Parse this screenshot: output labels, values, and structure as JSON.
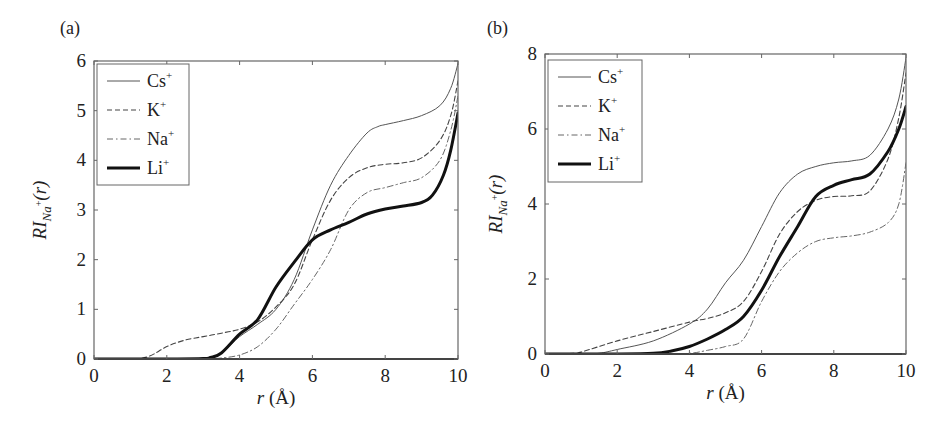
{
  "chart_data": [
    {
      "panel_label": "(a)",
      "type": "line",
      "title": "",
      "xlabel": "r (Å)",
      "xlabel_italic": "r",
      "xlabel_unit": "(Å)",
      "ylabel": "RI_Na+(r)",
      "xlim": [
        0,
        10
      ],
      "ylim": [
        0,
        6
      ],
      "xticks": [
        0,
        2,
        4,
        6,
        8,
        10
      ],
      "yticks": [
        0,
        1,
        2,
        3,
        4,
        5,
        6
      ],
      "grid": false,
      "legend_position": "upper left",
      "series": [
        {
          "name": "Cs+",
          "label": "Cs",
          "style": "solid-thin",
          "x": [
            0,
            1,
            2,
            3,
            3.3,
            3.6,
            4,
            4.5,
            5,
            5.5,
            6,
            6.5,
            7,
            7.5,
            7.8,
            8,
            8.5,
            9,
            9.5,
            9.8,
            10
          ],
          "y": [
            0,
            0,
            0,
            0,
            0.03,
            0.18,
            0.45,
            0.7,
            1.0,
            1.6,
            2.6,
            3.5,
            4.1,
            4.55,
            4.68,
            4.72,
            4.8,
            4.9,
            5.1,
            5.45,
            5.95
          ]
        },
        {
          "name": "K+",
          "label": "K",
          "style": "dashed",
          "x": [
            0,
            1,
            1.5,
            2,
            2.5,
            3,
            3.5,
            4,
            4.5,
            5,
            5.5,
            6,
            6.5,
            7,
            7.5,
            8,
            8.5,
            9,
            9.5,
            9.8,
            10
          ],
          "y": [
            0,
            0,
            0.05,
            0.25,
            0.38,
            0.45,
            0.52,
            0.6,
            0.75,
            1.05,
            1.5,
            2.4,
            3.2,
            3.65,
            3.85,
            3.92,
            3.95,
            4.05,
            4.4,
            4.9,
            5.6
          ]
        },
        {
          "name": "Na+",
          "label": "Na",
          "style": "dash-dot",
          "x": [
            0,
            1,
            2,
            3,
            3.5,
            4,
            4.5,
            5,
            5.5,
            6,
            6.5,
            7,
            7.5,
            8,
            8.5,
            9,
            9.5,
            9.8,
            10
          ],
          "y": [
            0,
            0,
            0,
            0,
            0.02,
            0.08,
            0.25,
            0.6,
            1.1,
            1.6,
            2.2,
            3.0,
            3.35,
            3.45,
            3.55,
            3.65,
            4.0,
            4.6,
            5.3
          ]
        },
        {
          "name": "Li+",
          "label": "Li",
          "style": "solid-thick",
          "x": [
            0,
            1,
            2,
            3,
            3.2,
            3.5,
            4,
            4.5,
            5,
            5.5,
            6,
            6.5,
            7,
            7.5,
            8,
            8.5,
            9,
            9.3,
            9.6,
            9.8,
            10
          ],
          "y": [
            0,
            0,
            0,
            0.01,
            0.03,
            0.12,
            0.5,
            0.8,
            1.45,
            1.95,
            2.4,
            2.6,
            2.75,
            2.92,
            3.02,
            3.08,
            3.15,
            3.3,
            3.7,
            4.2,
            4.95
          ]
        }
      ]
    },
    {
      "panel_label": "(b)",
      "type": "line",
      "title": "",
      "xlabel": "r (Å)",
      "xlabel_italic": "r",
      "xlabel_unit": "(Å)",
      "ylabel": "RI_Na+(r)",
      "xlim": [
        0,
        10
      ],
      "ylim": [
        0,
        8
      ],
      "xticks": [
        0,
        2,
        4,
        6,
        8,
        10
      ],
      "yticks": [
        0,
        2,
        4,
        6,
        8
      ],
      "grid": false,
      "legend_position": "upper left",
      "series": [
        {
          "name": "Cs+",
          "label": "Cs",
          "style": "solid-thin",
          "x": [
            0,
            1,
            1.5,
            2,
            3,
            4,
            4.5,
            5,
            5.5,
            6,
            6.5,
            7,
            7.5,
            8,
            8.5,
            9,
            9.5,
            9.8,
            10
          ],
          "y": [
            0,
            0,
            0.02,
            0.12,
            0.35,
            0.8,
            1.2,
            1.9,
            2.5,
            3.4,
            4.3,
            4.8,
            5.0,
            5.1,
            5.15,
            5.3,
            6.0,
            6.8,
            7.9
          ]
        },
        {
          "name": "K+",
          "label": "K",
          "style": "dashed",
          "x": [
            0,
            0.8,
            1,
            2,
            3,
            4,
            4.5,
            5,
            5.5,
            6,
            6.5,
            7,
            7.5,
            8,
            8.5,
            9,
            9.5,
            9.8,
            10
          ],
          "y": [
            0,
            0.02,
            0.05,
            0.35,
            0.6,
            0.85,
            0.95,
            1.1,
            1.4,
            2.2,
            3.2,
            3.8,
            4.1,
            4.2,
            4.22,
            4.35,
            5.2,
            6.3,
            7.5
          ]
        },
        {
          "name": "Na+",
          "label": "Na",
          "style": "dash-dot",
          "x": [
            0,
            1,
            2,
            3,
            4,
            4.5,
            5,
            5.5,
            6,
            6.5,
            7,
            7.5,
            8,
            8.5,
            9,
            9.5,
            9.8,
            10
          ],
          "y": [
            0,
            0,
            0,
            0,
            0.02,
            0.1,
            0.2,
            0.4,
            1.4,
            2.2,
            2.7,
            3.0,
            3.1,
            3.15,
            3.25,
            3.5,
            4.0,
            5.1
          ]
        },
        {
          "name": "Li+",
          "label": "Li",
          "style": "solid-thick",
          "x": [
            0,
            1,
            2,
            3,
            3.5,
            4,
            4.5,
            5,
            5.5,
            6,
            6.5,
            7,
            7.5,
            8,
            8.5,
            9,
            9.5,
            9.8,
            10
          ],
          "y": [
            0,
            0,
            0,
            0.02,
            0.08,
            0.2,
            0.4,
            0.65,
            1.0,
            1.7,
            2.6,
            3.4,
            4.2,
            4.5,
            4.65,
            4.8,
            5.4,
            6.0,
            6.6
          ]
        }
      ]
    }
  ],
  "legend_superscript": "+",
  "ylabel_parts": {
    "main": "RI",
    "subscript": "Na",
    "sub_superscript": "+",
    "arg": "(r)"
  },
  "colors": {
    "axes": "#555555",
    "series": "#333333",
    "thick": "#111111"
  }
}
